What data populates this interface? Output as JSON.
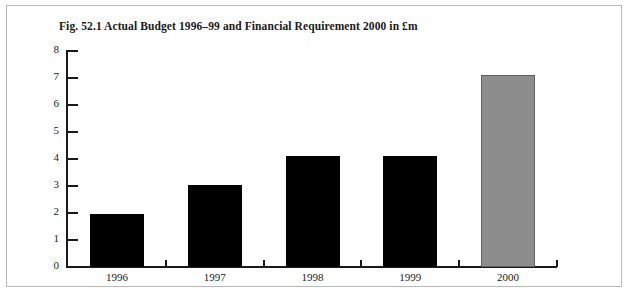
{
  "figure": {
    "caption": "Fig. 52.1 Actual Budget 1996–99 and Financial Requirement 2000 in £m"
  },
  "chart_data": {
    "type": "bar",
    "title": "Fig. 52.1 Actual Budget 1996–99 and Financial Requirement 2000 in £m",
    "xlabel": "",
    "ylabel": "",
    "ylim": [
      0,
      8
    ],
    "yticks": [
      "0",
      "1",
      "2",
      "3",
      "4",
      "5",
      "6",
      "7",
      "8"
    ],
    "grid": false,
    "legend": "none",
    "categories": [
      "1996",
      "1997",
      "1998",
      "1999",
      "2000"
    ],
    "values": [
      1.95,
      3.05,
      4.1,
      4.1,
      7.1
    ],
    "bar_colors": [
      "#000000",
      "#000000",
      "#000000",
      "#000000",
      "#8d8d8d"
    ],
    "series": [
      {
        "name": "Budget / Requirement (£m)",
        "values": [
          1.95,
          3.05,
          4.1,
          4.1,
          7.1
        ]
      }
    ]
  }
}
